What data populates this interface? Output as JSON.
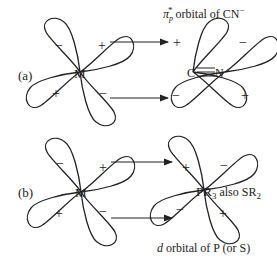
{
  "panel_a": {
    "label": "(a)",
    "metal": "M",
    "ligand_c": "C",
    "ligand_n": "N",
    "title_pi": "π",
    "title_sub": "p",
    "title_sup": "*",
    "title_rest": " orbital of CN",
    "title_charge": "−",
    "metal_lobes": {
      "upper_left": "−",
      "upper_right": "+",
      "lower_left": "+",
      "lower_right": "−"
    },
    "ligand_lobes": {
      "upper_left": "+",
      "upper_right": "−",
      "lower_left": "−",
      "lower_right": "+"
    }
  },
  "panel_b": {
    "label": "(b)",
    "metal": "M",
    "ligand": "PR",
    "ligand_sub": "3",
    "also_text": " also SR",
    "also_sub": "2",
    "caption_italic": "d",
    "caption_rest": " orbital of P (or S)",
    "metal_lobes": {
      "upper_left": "−",
      "upper_right": "+",
      "lower_left": "+",
      "lower_right": "−"
    },
    "ligand_lobes": {
      "upper_left": "+",
      "upper_right": "−",
      "lower_left": "−",
      "lower_right": "+"
    }
  }
}
